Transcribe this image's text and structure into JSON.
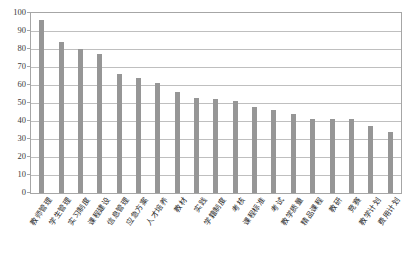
{
  "chart_data": {
    "type": "bar",
    "title": "",
    "xlabel": "",
    "ylabel": "",
    "ylim": [
      0,
      100
    ],
    "ytick_step": 10,
    "grid": true,
    "legend": "none",
    "bar_color": "#969696",
    "gridline_color": "#bfbfbf",
    "axis_color": "#a6a6a6",
    "ytick_labels": [
      "100",
      "90",
      "80",
      "70",
      "60",
      "50",
      "40",
      "30",
      "20",
      "10",
      "0"
    ],
    "categories": [
      "教师管理",
      "学生管理",
      "实习制度",
      "课程建设",
      "信息管理",
      "应急方案",
      "人才培养",
      "教材",
      "实践",
      "学籍制度",
      "考核",
      "课程标准",
      "考试",
      "教学质量",
      "精品课程",
      "教研",
      "竞赛",
      "教学计划",
      "费用计划"
    ],
    "values": [
      96,
      84,
      80,
      77,
      66,
      64,
      61,
      56,
      53,
      52,
      51,
      48,
      46,
      44,
      41,
      41,
      41,
      37,
      34
    ]
  }
}
